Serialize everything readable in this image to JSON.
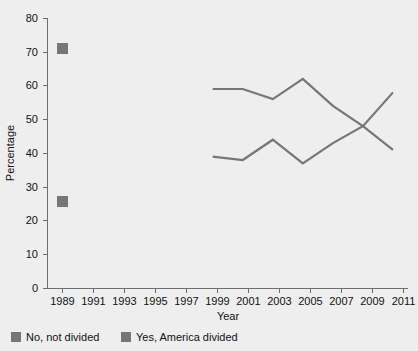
{
  "chart_data": {
    "type": "line",
    "title": "",
    "xlabel": "Year",
    "ylabel": "Percentage",
    "xlim": [
      1988,
      2012
    ],
    "ylim": [
      0,
      80
    ],
    "xticks": [
      1989,
      1991,
      1993,
      1995,
      1997,
      1999,
      2001,
      2003,
      2005,
      2007,
      2009,
      2011
    ],
    "yticks": [
      0,
      10,
      20,
      30,
      40,
      50,
      60,
      70,
      80
    ],
    "grid": false,
    "legend_position": "bottom",
    "series": [
      {
        "name": "No, not divided",
        "color": "#767676",
        "x": [
          1989,
          1999,
          2001,
          2003,
          2005,
          2007,
          2009,
          2011
        ],
        "values": [
          71,
          59,
          59,
          56,
          62,
          54,
          48,
          41
        ]
      },
      {
        "name": "Yes, America divided",
        "color": "#767676",
        "x": [
          1989,
          1999,
          2001,
          2003,
          2005,
          2007,
          2009,
          2011
        ],
        "values": [
          26,
          39,
          38,
          44,
          37,
          43,
          48,
          58
        ]
      }
    ]
  },
  "axes": {
    "y_title": "Percentage",
    "x_title": "Year",
    "y_tick_labels": [
      "0",
      "10",
      "20",
      "30",
      "40",
      "50",
      "60",
      "70",
      "80"
    ],
    "x_tick_labels": [
      "1989",
      "1991",
      "1993",
      "1995",
      "1997",
      "1999",
      "2001",
      "2003",
      "2005",
      "2007",
      "2009",
      "2011"
    ]
  },
  "legend": {
    "items": [
      {
        "label": "No, not divided",
        "color": "#767676"
      },
      {
        "label": "Yes, America divided",
        "color": "#767676"
      }
    ]
  },
  "colors": {
    "background": "#eeeeee",
    "plot_background": "#eeeeee",
    "series": "#767676",
    "axis": "#6d6d6d",
    "text": "#111111"
  }
}
